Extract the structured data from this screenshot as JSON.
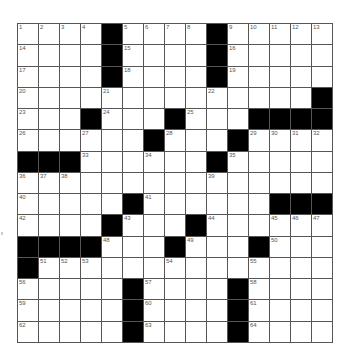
{
  "puzzle": {
    "rows": 15,
    "cols": 15,
    "grid": [
      [
        "1",
        "2",
        "3",
        "4",
        "#",
        "5",
        "6",
        "7",
        "8",
        "#",
        "9",
        "10",
        "11",
        "12",
        "13"
      ],
      [
        "14",
        "",
        "",
        "",
        "#",
        "15",
        "",
        "",
        "",
        "#",
        "16",
        "",
        "",
        "",
        ""
      ],
      [
        "17",
        "",
        "",
        "",
        "#",
        "18",
        "",
        "",
        "",
        "#",
        "19",
        "",
        "",
        "",
        ""
      ],
      [
        "20",
        "",
        "",
        "",
        "21",
        "",
        "",
        "",
        "",
        "22",
        "",
        "",
        "",
        "",
        "#"
      ],
      [
        "23",
        "",
        "",
        "#",
        "24",
        "",
        "",
        "#",
        "25",
        "",
        "",
        "#",
        "#",
        "#",
        "#"
      ],
      [
        "26",
        "",
        "",
        "27",
        "",
        "",
        "#",
        "28",
        "",
        "",
        "#",
        "29",
        "30",
        "31",
        "32"
      ],
      [
        "#",
        "#",
        "#",
        "33",
        "",
        "",
        "34",
        "",
        "",
        "#",
        "35",
        "",
        "",
        "",
        ""
      ],
      [
        "36",
        "37",
        "38",
        "",
        "",
        "",
        "",
        "",
        "",
        "39",
        "",
        "",
        "",
        "",
        ""
      ],
      [
        "40",
        "",
        "",
        "",
        "",
        "#",
        "41",
        "",
        "",
        "",
        "",
        "",
        "#",
        "#",
        "#"
      ],
      [
        "42",
        "",
        "",
        "",
        "#",
        "43",
        "",
        "",
        "#",
        "44",
        "",
        "",
        "45",
        "46",
        "47"
      ],
      [
        "#",
        "#",
        "#",
        "#",
        "48",
        "",
        "",
        "#",
        "49",
        "",
        "",
        "#",
        "50",
        "",
        ""
      ],
      [
        "#",
        "51",
        "52",
        "53",
        "",
        "",
        "",
        "54",
        "",
        "",
        "",
        "55",
        "",
        "",
        ""
      ],
      [
        "56",
        "",
        "",
        "",
        "",
        "#",
        "57",
        "",
        "",
        "",
        "#",
        "58",
        "",
        "",
        ""
      ],
      [
        "59",
        "",
        "",
        "",
        "",
        "#",
        "60",
        "",
        "",
        "",
        "#",
        "61",
        "",
        "",
        ""
      ],
      [
        "62",
        "",
        "",
        "",
        "",
        "#",
        "63",
        "",
        "",
        "",
        "#",
        "64",
        "",
        "",
        ""
      ]
    ]
  },
  "colors": {
    "block": "#000000",
    "line": "#555555",
    "number": "#555555",
    "background": "#ffffff"
  }
}
